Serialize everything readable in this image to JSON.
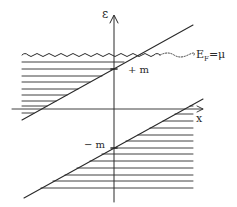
{
  "diagram": {
    "type": "energy-band diagram (hand-drawn)",
    "axes": {
      "vertical_label": "ε",
      "horizontal_label": "x"
    },
    "labels": {
      "upper_band_edge": "+ m",
      "lower_band_edge": "− m",
      "fermi_level": "E",
      "fermi_sub": "F",
      "fermi_eq": "=μ"
    },
    "colors": {
      "ink": "#2a2a2a",
      "background": "#ffffff"
    },
    "elements": {
      "upper_line": "ε = +m + slope·x (filled below Fermi level, left side)",
      "lower_line": "ε = −m + slope·x (filled below, right side)",
      "fermi_line": "wavy line at E_F = μ, continuing dotted to the right"
    }
  }
}
